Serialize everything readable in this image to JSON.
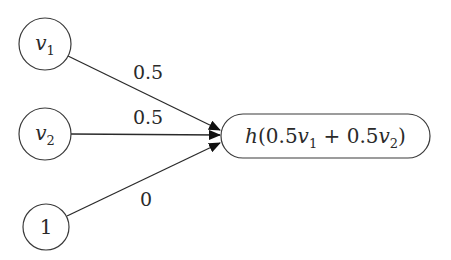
{
  "diagram": {
    "type": "neural-network-neuron",
    "inputs": [
      {
        "id": "v1",
        "var": "v",
        "sub": "1",
        "cx": 45,
        "cy": 44,
        "r": 26,
        "weight": "0.5",
        "label_x": 148,
        "label_y": 79
      },
      {
        "id": "v2",
        "var": "v",
        "sub": "2",
        "cx": 45,
        "cy": 134,
        "r": 26,
        "weight": "0.5",
        "label_x": 148,
        "label_y": 124
      },
      {
        "id": "bias",
        "var": "",
        "sub": "",
        "text": "1",
        "cx": 46,
        "cy": 227,
        "r": 23,
        "weight": "0",
        "label_x": 146,
        "label_y": 206
      }
    ],
    "output": {
      "label_prefix": "h(0.5",
      "v1": "v",
      "v1_sub": "1",
      "plus": " + 0.5",
      "v2": "v",
      "v2_sub": "2",
      "suffix": ")",
      "full_text": "h(0.5v1 + 0.5v2)",
      "x": 221,
      "y": 114,
      "width": 209,
      "height": 44
    },
    "colors": {
      "stroke": "#3a3a3a",
      "text": "#2a2a2a",
      "background": "#ffffff"
    }
  }
}
